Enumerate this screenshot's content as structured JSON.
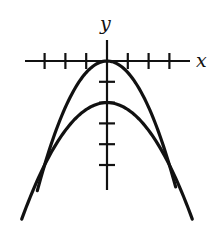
{
  "chart_data": {
    "type": "line",
    "title": "",
    "xlabel": "x",
    "ylabel": "y",
    "grid": false,
    "legend": null,
    "x_ticks": [
      -3,
      -2,
      -1,
      1,
      2,
      3
    ],
    "y_ticks": [
      -1,
      -2,
      -3,
      -4,
      -5
    ],
    "xlim": [
      -3,
      4
    ],
    "ylim": [
      -6,
      2
    ],
    "series": [
      {
        "name": "narrow parabola",
        "equation": "y = -(5/9)x^2",
        "vertex": [
          0,
          0
        ],
        "x": [
          -3.35,
          -3,
          -2,
          -1,
          0,
          1,
          2,
          3,
          3.3
        ],
        "y": [
          -6.24,
          -5,
          -2.22,
          -0.56,
          0,
          -0.56,
          -2.22,
          -5,
          -6.05
        ]
      },
      {
        "name": "wide parabola",
        "equation": "y = -(1/3)x^2 - 2",
        "vertex": [
          0,
          -2
        ],
        "x": [
          -4.1,
          -3,
          -2,
          -1,
          0,
          1,
          2,
          3,
          4.1
        ],
        "y": [
          -7.6,
          -5,
          -3.33,
          -2.33,
          -2,
          -2.33,
          -3.33,
          -5,
          -7.6
        ]
      }
    ],
    "intersections": [
      [
        -3,
        -5
      ],
      [
        3,
        -5
      ]
    ]
  },
  "axes": {
    "x_label": "x",
    "y_label": "y"
  },
  "style": {
    "stroke": "#111111",
    "background": "#ffffff"
  }
}
